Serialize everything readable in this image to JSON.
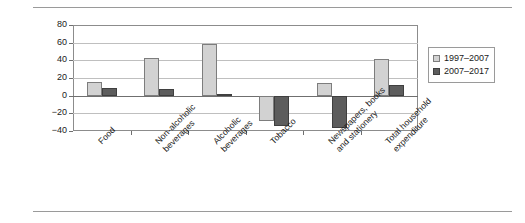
{
  "chart_data": {
    "type": "bar",
    "title": "",
    "xlabel": "",
    "ylabel": "Percentage change",
    "ylim": [
      -40,
      80
    ],
    "ytick_step": 20,
    "yticks": [
      "80",
      "60",
      "40",
      "20",
      "0",
      "−20",
      "−40"
    ],
    "grid": true,
    "legend_position": "right",
    "categories": [
      "Food",
      "Non-alcoholic\nbeverages",
      "Alcoholic\nbeverages",
      "Tobacco",
      "Newspapers, books\nand stationery",
      "Total household\nexpenditure"
    ],
    "series": [
      {
        "name": "1997–2007",
        "color": "#d2d2d2",
        "values": [
          16,
          43,
          59,
          -29,
          14,
          42
        ]
      },
      {
        "name": "2007–2017",
        "color": "#5d5d5d",
        "values": [
          9,
          8,
          2,
          -34,
          -37,
          12
        ]
      }
    ]
  },
  "legend": {
    "entries": [
      {
        "label": "1997–2007"
      },
      {
        "label": "2007–2017"
      }
    ]
  }
}
